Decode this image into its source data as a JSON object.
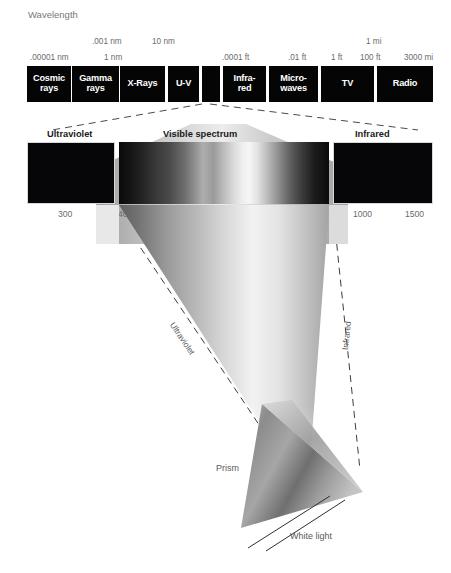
{
  "figure": {
    "title": "Wavelength",
    "axis_caption": "Wavelength (nanometers)"
  },
  "scale_row_upper": [
    {
      "label": ".001 nm",
      "x": 92
    },
    {
      "label": "10 nm",
      "x": 152
    }
  ],
  "scale_row_upper_right": [
    {
      "label": "1 mi",
      "x": 366
    }
  ],
  "scale_row_lower": [
    {
      "label": ".00001 nm",
      "x": 30
    },
    {
      "label": "1 nm",
      "x": 104
    },
    {
      "label": ".0001 ft",
      "x": 222
    },
    {
      "label": ".01 ft",
      "x": 288
    },
    {
      "label": "1 ft",
      "x": 331
    },
    {
      "label": "100 ft",
      "x": 360
    },
    {
      "label": "3000 mi",
      "x": 404
    }
  ],
  "em_bands": [
    {
      "name": "cosmic-rays",
      "label": "Cosmic\nrays",
      "left": 0,
      "width": 44
    },
    {
      "name": "gamma-rays",
      "label": "Gamma\nrays",
      "left": 45,
      "width": 47
    },
    {
      "name": "x-rays",
      "label": "X-Rays",
      "left": 93,
      "width": 45
    },
    {
      "name": "u-v",
      "label": "U-V",
      "left": 141,
      "width": 31
    },
    {
      "name": "visible",
      "label": "",
      "left": 175,
      "width": 18
    },
    {
      "name": "infrared",
      "label": "Infra-\nred",
      "left": 196,
      "width": 43
    },
    {
      "name": "microwaves",
      "label": "Micro-\nwaves",
      "left": 242,
      "width": 49
    },
    {
      "name": "tv",
      "label": "TV",
      "left": 294,
      "width": 53
    },
    {
      "name": "radio",
      "label": "Radio",
      "left": 350,
      "width": 56
    }
  ],
  "panels": {
    "ultraviolet": {
      "title": "Ultraviolet"
    },
    "visible": {
      "title": "Visible spectrum"
    },
    "infrared": {
      "title": "Infrared"
    }
  },
  "nm_ticks": [
    {
      "label": "300",
      "x": 58
    },
    {
      "label": "400",
      "x": 118
    },
    {
      "label": "500",
      "x": 181
    },
    {
      "label": "600",
      "x": 245
    },
    {
      "label": "700",
      "x": 304
    },
    {
      "label": "1000",
      "x": 353
    },
    {
      "label": "1500",
      "x": 405
    }
  ],
  "ray_labels": {
    "ultraviolet": "Ultraviolet",
    "infrared": "Infrared"
  },
  "prism_labels": {
    "prism": "Prism",
    "white_light": "White light"
  },
  "chart_data": {
    "type": "bar",
    "xlabel": "Wavelength (nanometers)",
    "ylabel": "",
    "grid": false,
    "legend": "none",
    "em_spectrum_scale_labels": [
      ".00001 nm",
      ".001 nm",
      "1 nm",
      "10 nm",
      ".0001 ft",
      ".01 ft",
      "1 ft",
      "100 ft",
      "1 mi",
      "3000 mi"
    ],
    "categories": [
      "Cosmic rays",
      "Gamma rays",
      "X-Rays",
      "U-V",
      "Visible",
      "Infrared",
      "Microwaves",
      "TV",
      "Radio"
    ],
    "values": [
      44,
      47,
      45,
      31,
      18,
      43,
      49,
      53,
      56
    ],
    "visible_axis_ticks_nm": [
      300,
      400,
      500,
      600,
      700,
      1000,
      1500
    ],
    "visible_range_nm": [
      400,
      700
    ],
    "ultraviolet_range_nm": [
      280,
      400
    ],
    "infrared_range_nm": [
      700,
      1600
    ],
    "annotations": [
      "Ultraviolet",
      "Visible spectrum",
      "Infrared",
      "Prism",
      "White light"
    ]
  }
}
